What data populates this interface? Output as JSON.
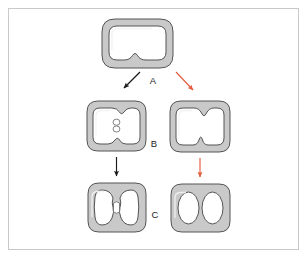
{
  "figure": {
    "background_color": "#ffffff",
    "frame_border_color": "#c9c9c9",
    "stage_labels": [
      {
        "id": "A",
        "text": "A"
      },
      {
        "id": "B",
        "text": "B"
      },
      {
        "id": "C",
        "text": "C"
      }
    ],
    "colors": {
      "ring_fill": "#c9c9c9",
      "ring_outline": "#545454",
      "ring_highlight": "#f2f2f2",
      "cavity_fill": "#ffffff",
      "arrow_black": "#1a1a1a",
      "arrow_red": "#e35b3c",
      "label_color": "#1d1d1d"
    },
    "arrows": [
      {
        "id": "a-to-left-b",
        "color_name": "black",
        "color": "#1a1a1a",
        "direction": "down-left"
      },
      {
        "id": "a-to-right-b",
        "color_name": "red",
        "color": "#e35b3c",
        "direction": "down-right"
      },
      {
        "id": "left-b-to-left-c",
        "color_name": "black",
        "color": "#1a1a1a",
        "direction": "down"
      },
      {
        "id": "right-b-to-right-c",
        "color_name": "red",
        "color": "#e35b3c",
        "direction": "down"
      }
    ],
    "shapes": [
      {
        "id": "stage-a-cell",
        "label": "A",
        "row": "top",
        "column": "center",
        "description": "Single rounded-square ring with a shallow inward notch at the bottom of the cavity"
      },
      {
        "id": "stage-b-left-cell",
        "label": "B",
        "row": "middle",
        "column": "left",
        "description": "Ring with cavity notched top and bottom, small figure-eight body at the center"
      },
      {
        "id": "stage-b-right-cell",
        "label": "B",
        "row": "middle",
        "column": "right",
        "description": "Ring with deep opposing constrictions forming two lobes that meet in the middle"
      },
      {
        "id": "stage-c-left-cell",
        "label": "C",
        "row": "bottom",
        "column": "left",
        "description": "Two kidney-shaped cavities joined by a narrow central bridge"
      },
      {
        "id": "stage-c-right-cell",
        "label": "C",
        "row": "bottom",
        "column": "right",
        "description": "Two fully separated oval cavities inside one ring"
      }
    ]
  }
}
